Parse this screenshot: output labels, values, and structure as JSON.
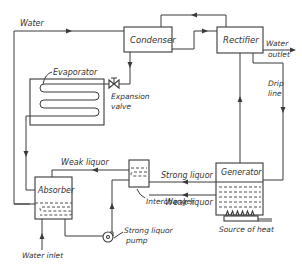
{
  "diagram": {
    "components": {
      "condenser": "Condenser",
      "rectifier": "Rectifier",
      "evaporator": "Evaporator",
      "expansion_valve_line1": "Expansion",
      "expansion_valve_line2": "valve",
      "generator": "Generator",
      "absorber": "Absorber",
      "interchanger": "Interchanger",
      "pump_line1": "Strong liquor",
      "pump_line2": "pump",
      "heat_source": "Source of heat"
    },
    "flow_labels": {
      "water_top": "Water",
      "water_outlet_line1": "Water",
      "water_outlet_line2": "outlet",
      "drip_line_line1": "Drip",
      "drip_line_line2": "line",
      "strong_liquor": "Strong liquor",
      "weak_liquor_right": "Weak liquor",
      "weak_liquor_left": "Weak liquor",
      "water_inlet": "Water inlet"
    },
    "colors": {
      "line": "#3a3a3a",
      "text": "#333333",
      "background": "#ffffff"
    }
  }
}
